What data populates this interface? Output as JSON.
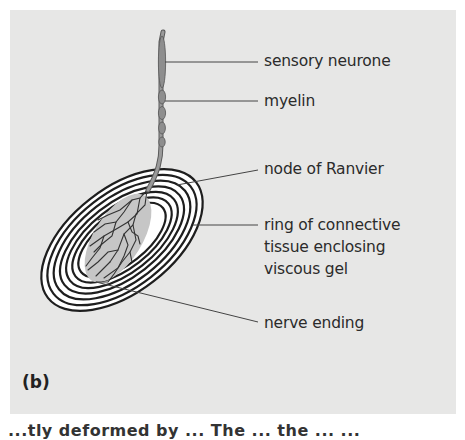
{
  "figure": {
    "panel_letter": "(b)",
    "labels": {
      "sensory_neurone": "sensory neurone",
      "myelin": "myelin",
      "node_of_ranvier": "node of Ranvier",
      "ring_line1": "ring of connective",
      "ring_line2": "tissue enclosing",
      "ring_line3": "viscous gel",
      "nerve_ending": "nerve ending"
    },
    "colors": {
      "panel_background": "#e7e7e6",
      "ring_stroke": "#1e1e1e",
      "gel_fill": "#c9c9c9",
      "neurone_fill": "#8a8a8a",
      "label_text": "#2b2b2b"
    },
    "ring_count": 7
  },
  "caption_cutoff": "...tly deformed by ... The ... the ... ..."
}
